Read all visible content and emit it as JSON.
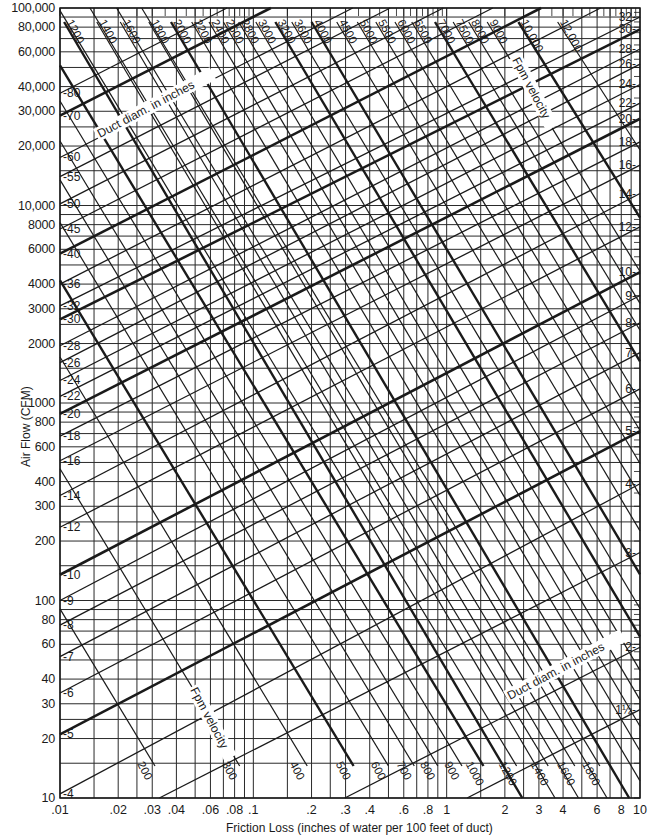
{
  "chart_data": {
    "type": "line",
    "xlabel": "Friction Loss (inches of water per 100 feet of duct)",
    "ylabel": "Air Flow (CFM)",
    "xscale": "log",
    "yscale": "log",
    "xlim": [
      0.01,
      10
    ],
    "ylim": [
      10,
      100000
    ],
    "grid": true,
    "x_ticks": [
      {
        "v": 0.01,
        "label": ".01"
      },
      {
        "v": 0.02,
        "label": ".02"
      },
      {
        "v": 0.03,
        "label": ".03"
      },
      {
        "v": 0.04,
        "label": ".04"
      },
      {
        "v": 0.06,
        "label": ".06"
      },
      {
        "v": 0.08,
        "label": ".08"
      },
      {
        "v": 0.1,
        "label": ".1"
      },
      {
        "v": 0.2,
        "label": ".2"
      },
      {
        "v": 0.3,
        "label": ".3"
      },
      {
        "v": 0.4,
        "label": ".4"
      },
      {
        "v": 0.6,
        "label": ".6"
      },
      {
        "v": 0.8,
        "label": ".8"
      },
      {
        "v": 1,
        "label": "1"
      },
      {
        "v": 2,
        "label": "2"
      },
      {
        "v": 3,
        "label": "3"
      },
      {
        "v": 4,
        "label": "4"
      },
      {
        "v": 6,
        "label": "6"
      },
      {
        "v": 8,
        "label": "8"
      },
      {
        "v": 10,
        "label": "10"
      }
    ],
    "x_minor_grid": [
      0.015,
      0.025,
      0.05,
      0.07,
      0.09,
      0.15,
      0.25,
      0.5,
      0.7,
      0.9,
      1.5,
      2.5,
      5,
      7,
      9
    ],
    "y_ticks": [
      {
        "v": 10,
        "label": "10"
      },
      {
        "v": 20,
        "label": "20"
      },
      {
        "v": 30,
        "label": "30"
      },
      {
        "v": 40,
        "label": "40"
      },
      {
        "v": 60,
        "label": "60"
      },
      {
        "v": 80,
        "label": "80"
      },
      {
        "v": 100,
        "label": "100"
      },
      {
        "v": 200,
        "label": "200"
      },
      {
        "v": 300,
        "label": "300"
      },
      {
        "v": 400,
        "label": "400"
      },
      {
        "v": 600,
        "label": "600"
      },
      {
        "v": 800,
        "label": "800"
      },
      {
        "v": 1000,
        "label": "1000"
      },
      {
        "v": 2000,
        "label": "2000"
      },
      {
        "v": 3000,
        "label": "3000"
      },
      {
        "v": 4000,
        "label": "4000"
      },
      {
        "v": 6000,
        "label": "6000"
      },
      {
        "v": 8000,
        "label": "8000"
      },
      {
        "v": 10000,
        "label": "10,000"
      },
      {
        "v": 20000,
        "label": "20,000"
      },
      {
        "v": 30000,
        "label": "30,000"
      },
      {
        "v": 40000,
        "label": "40,000"
      },
      {
        "v": 60000,
        "label": "60,000"
      },
      {
        "v": 80000,
        "label": "80,000"
      },
      {
        "v": 100000,
        "label": "100,000"
      }
    ],
    "y_minor_grid": [
      15,
      25,
      50,
      70,
      90,
      150,
      250,
      500,
      700,
      900,
      1500,
      2500,
      5000,
      7000,
      9000,
      15000,
      25000,
      50000,
      70000,
      90000
    ],
    "series_group_diameter": {
      "name": "Duct diam. in inches",
      "note": "lines rise left-to-right; Q at f=.01 (left) and f=10 (right)",
      "slope_logQ_per_logf": 0.5,
      "left_labels": [
        {
          "d": "80",
          "q_left": 37000,
          "bold": false
        },
        {
          "d": "70",
          "q_left": 28500,
          "bold": true
        },
        {
          "d": "60",
          "q_left": 17500,
          "bold": false
        },
        {
          "d": "55",
          "q_left": 14000,
          "bold": false
        },
        {
          "d": "50",
          "q_left": 10200,
          "bold": false
        },
        {
          "d": "45",
          "q_left": 7600,
          "bold": false
        },
        {
          "d": "40",
          "q_left": 5700,
          "bold": true
        },
        {
          "d": "36",
          "q_left": 4000,
          "bold": false
        },
        {
          "d": "32",
          "q_left": 3100,
          "bold": false
        },
        {
          "d": "30",
          "q_left": 2650,
          "bold": true
        },
        {
          "d": "28",
          "q_left": 1950,
          "bold": false
        },
        {
          "d": "26",
          "q_left": 1600,
          "bold": false
        },
        {
          "d": "24",
          "q_left": 1300,
          "bold": false
        },
        {
          "d": "22",
          "q_left": 1080,
          "bold": false
        },
        {
          "d": "20",
          "q_left": 880,
          "bold": true
        },
        {
          "d": "18",
          "q_left": 680,
          "bold": false
        },
        {
          "d": "16",
          "q_left": 510,
          "bold": false
        },
        {
          "d": "14",
          "q_left": 340,
          "bold": false
        },
        {
          "d": "12",
          "q_left": 235,
          "bold": false
        },
        {
          "d": "10",
          "q_left": 135,
          "bold": true
        },
        {
          "d": "9",
          "q_left": 100,
          "bold": false
        },
        {
          "d": "8",
          "q_left": 75,
          "bold": false
        },
        {
          "d": "7",
          "q_left": 52,
          "bold": false
        },
        {
          "d": "6",
          "q_left": 34,
          "bold": false
        },
        {
          "d": "5",
          "q_left": 21,
          "bold": true
        },
        {
          "d": "4",
          "q_left": 10.5,
          "bold": false
        }
      ],
      "right_labels": [
        {
          "d": "32",
          "q_right": 90000
        },
        {
          "d": "30",
          "q_right": 78000
        },
        {
          "d": "28",
          "q_right": 62000
        },
        {
          "d": "26",
          "q_right": 52000
        },
        {
          "d": "24",
          "q_right": 41000
        },
        {
          "d": "22",
          "q_right": 33000
        },
        {
          "d": "20",
          "q_right": 27500
        },
        {
          "d": "18",
          "q_right": 21000
        },
        {
          "d": "16",
          "q_right": 16000
        },
        {
          "d": "14",
          "q_right": 11500
        },
        {
          "d": "12",
          "q_right": 7800
        },
        {
          "d": "10",
          "q_right": 4600
        },
        {
          "d": "9",
          "q_right": 3500
        },
        {
          "d": "8",
          "q_right": 2550
        },
        {
          "d": "7",
          "q_right": 1800
        },
        {
          "d": "6",
          "q_right": 1180
        },
        {
          "d": "5",
          "q_right": 720
        },
        {
          "d": "4",
          "q_right": 390
        },
        {
          "d": "3",
          "q_right": 175
        },
        {
          "d": "2",
          "q_right": 58
        },
        {
          "d": "1½",
          "q_right": 28
        }
      ]
    },
    "series_group_velocity": {
      "name": "Fpm velocity",
      "note": "lines fall left-to-right; endpoints given as f at Q=100000 (top) and f at Q=10 (bottom)",
      "top_labels": [
        {
          "v": "1200",
          "f_top": 0.0105,
          "bold": true
        },
        {
          "v": "1400",
          "f_top": 0.0155,
          "bold": false
        },
        {
          "v": "1600",
          "f_top": 0.0205,
          "bold": false
        },
        {
          "v": "1800",
          "f_top": 0.0288,
          "bold": false
        },
        {
          "v": "2000",
          "f_top": 0.0375,
          "bold": true
        },
        {
          "v": "2200",
          "f_top": 0.048,
          "bold": false
        },
        {
          "v": "2400",
          "f_top": 0.059,
          "bold": false
        },
        {
          "v": "2600",
          "f_top": 0.07,
          "bold": false
        },
        {
          "v": "2800",
          "f_top": 0.084,
          "bold": false
        },
        {
          "v": "3000",
          "f_top": 0.103,
          "bold": false
        },
        {
          "v": "3200",
          "f_top": 0.13,
          "bold": true
        },
        {
          "v": "3600",
          "f_top": 0.158,
          "bold": false
        },
        {
          "v": "4000",
          "f_top": 0.2,
          "bold": true
        },
        {
          "v": "4500",
          "f_top": 0.27,
          "bold": false
        },
        {
          "v": "5000",
          "f_top": 0.345,
          "bold": false
        },
        {
          "v": "5500",
          "f_top": 0.43,
          "bold": false
        },
        {
          "v": "6000",
          "f_top": 0.54,
          "bold": false
        },
        {
          "v": "6500",
          "f_top": 0.66,
          "bold": false
        },
        {
          "v": "7000",
          "f_top": 0.87,
          "bold": true
        },
        {
          "v": "7500",
          "f_top": 1.08,
          "bold": false
        },
        {
          "v": "8000",
          "f_top": 1.3,
          "bold": false
        },
        {
          "v": "9000",
          "f_top": 1.62,
          "bold": false
        },
        {
          "v": "10,000",
          "f_top": 2.35,
          "bold": true
        },
        {
          "v": "12,000",
          "f_top": 3.75,
          "bold": false
        }
      ],
      "bottom_labels": [
        {
          "v": "200",
          "f_bottom": 0.031,
          "bold": false
        },
        {
          "v": "300",
          "f_bottom": 0.085,
          "bold": false
        },
        {
          "v": "400",
          "f_bottom": 0.19,
          "bold": false
        },
        {
          "v": "500",
          "f_bottom": 0.33,
          "bold": true
        },
        {
          "v": "600",
          "f_bottom": 0.5,
          "bold": false
        },
        {
          "v": "700",
          "f_bottom": 0.68,
          "bold": false
        },
        {
          "v": "800",
          "f_bottom": 0.9,
          "bold": false
        },
        {
          "v": "900",
          "f_bottom": 1.2,
          "bold": false
        },
        {
          "v": "1000",
          "f_bottom": 1.55,
          "bold": true
        },
        {
          "v": "1200",
          "f_bottom": 2.3,
          "bold": false
        },
        {
          "v": "1400",
          "f_bottom": 3.35,
          "bold": false
        },
        {
          "v": "1600",
          "f_bottom": 4.6,
          "bold": false
        },
        {
          "v": "1800",
          "f_bottom": 6.2,
          "bold": false
        }
      ],
      "pixel_slope_dx_per_dy": 0.58
    },
    "annotations": [
      {
        "text": "Duct diam. in inches",
        "at": "upper-left",
        "x": 100,
        "y": 138,
        "angle": -28
      },
      {
        "text": "Fpm velocity",
        "at": "upper-right",
        "x": 512,
        "y": 60,
        "angle": 62
      },
      {
        "text": "Fpm velocity",
        "at": "lower-left",
        "x": 190,
        "y": 690,
        "angle": 62
      },
      {
        "text": "Duct diam. in inches",
        "at": "lower-right",
        "x": 510,
        "y": 700,
        "angle": -28
      }
    ]
  },
  "labels": {
    "x_axis_title": "Friction Loss (inches of water per 100 feet of duct)",
    "y_axis_title": "Air Flow (CFM)"
  },
  "colors": {
    "ink": "#1a1a1a",
    "grid": "#2a2a2a",
    "background": "#ffffff"
  }
}
